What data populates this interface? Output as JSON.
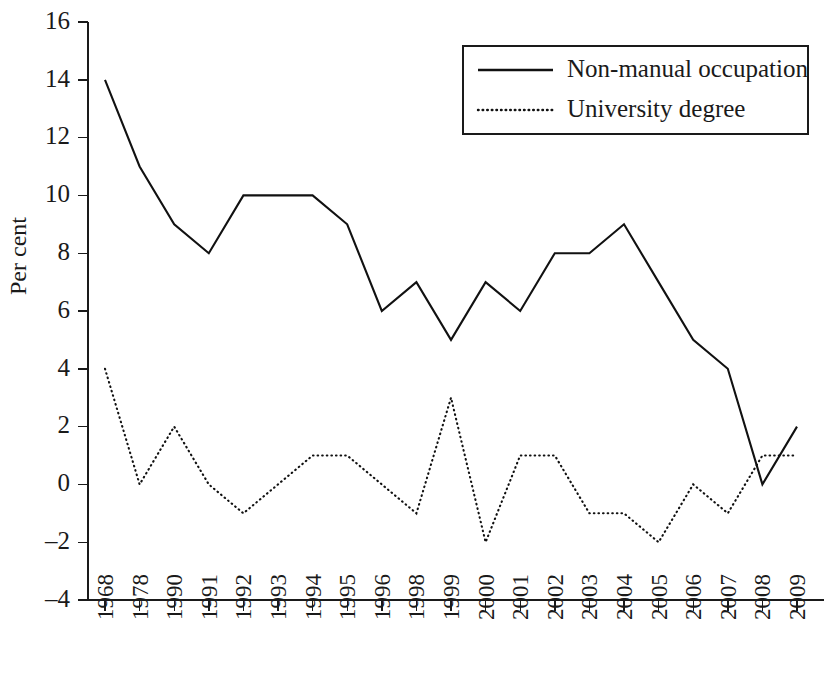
{
  "chart_data": {
    "type": "line",
    "title": "",
    "xlabel": "",
    "ylabel": "Per cent",
    "ylim": [
      -4,
      16
    ],
    "yticks": [
      -4,
      -2,
      0,
      2,
      4,
      6,
      8,
      10,
      12,
      14,
      16
    ],
    "ytick_labels": [
      "–4",
      "–2",
      "0",
      "2",
      "4",
      "6",
      "8",
      "10",
      "12",
      "14",
      "16"
    ],
    "grid": false,
    "legend_position": "top-right",
    "categories": [
      "1968",
      "1978",
      "1990",
      "1991",
      "1992",
      "1993",
      "1994",
      "1995",
      "1996",
      "1998",
      "1999",
      "2000",
      "2001",
      "2002",
      "2003",
      "2004",
      "2005",
      "2006",
      "2007",
      "2008",
      "2009"
    ],
    "series": [
      {
        "name": "Non-manual occupation",
        "style": "solid",
        "values": [
          14,
          11,
          9,
          8,
          10,
          10,
          10,
          9,
          6,
          7,
          5,
          7,
          6,
          8,
          8,
          9,
          7,
          5,
          4,
          0,
          2
        ]
      },
      {
        "name": "University degree",
        "style": "dotted",
        "values": [
          4,
          0,
          2,
          0,
          -1,
          0,
          1,
          1,
          0,
          -1,
          3,
          -2,
          1,
          1,
          -1,
          -1,
          -2,
          0,
          -1,
          1,
          1
        ]
      }
    ]
  },
  "legend": {
    "entries": [
      {
        "label": "Non-manual occupation",
        "style": "solid"
      },
      {
        "label": "University degree",
        "style": "dotted"
      }
    ]
  },
  "colors": {
    "line": "#111111",
    "axis": "#1a1a1a",
    "background": "#ffffff"
  }
}
